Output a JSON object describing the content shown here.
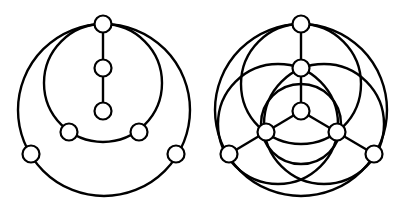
{
  "figures": [
    {
      "name": "left-graph",
      "node_radius": 8.5,
      "circles": [
        {
          "cx": 104,
          "cy": 110,
          "r": 86
        },
        {
          "cx": 103,
          "cy": 83,
          "r": 59
        }
      ],
      "lines": [
        {
          "x1": 103,
          "y1": 24,
          "x2": 103,
          "y2": 111
        }
      ],
      "nodes": [
        {
          "x": 103,
          "y": 24
        },
        {
          "x": 103,
          "y": 68
        },
        {
          "x": 103,
          "y": 111
        },
        {
          "x": 69,
          "y": 132
        },
        {
          "x": 139,
          "y": 132
        },
        {
          "x": 31,
          "y": 154
        },
        {
          "x": 176,
          "y": 154
        }
      ]
    },
    {
      "name": "right-graph",
      "node_radius": 8.5,
      "circles": [
        {
          "cx": 301,
          "cy": 110,
          "r": 86
        },
        {
          "cx": 301,
          "cy": 84,
          "r": 60
        },
        {
          "cx": 278,
          "cy": 124,
          "r": 60
        },
        {
          "cx": 324,
          "cy": 124,
          "r": 60
        },
        {
          "cx": 301,
          "cy": 124,
          "r": 40
        }
      ],
      "lines": [
        {
          "x1": 301,
          "y1": 24,
          "x2": 301,
          "y2": 111
        },
        {
          "x1": 301,
          "y1": 111,
          "x2": 229,
          "y2": 154
        },
        {
          "x1": 301,
          "y1": 111,
          "x2": 374,
          "y2": 154
        }
      ],
      "nodes": [
        {
          "x": 301,
          "y": 24
        },
        {
          "x": 301,
          "y": 68
        },
        {
          "x": 301,
          "y": 111
        },
        {
          "x": 266,
          "y": 132
        },
        {
          "x": 337,
          "y": 132
        },
        {
          "x": 229,
          "y": 154
        },
        {
          "x": 374,
          "y": 154
        }
      ]
    }
  ]
}
